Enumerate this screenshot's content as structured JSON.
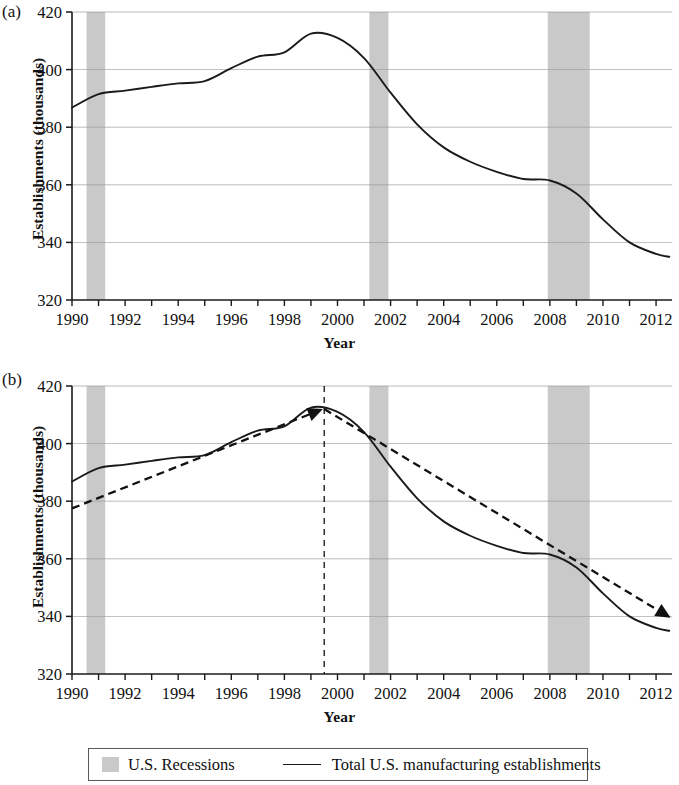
{
  "figure": {
    "panels": [
      {
        "letter": "(a)",
        "xlabel": "Year",
        "ylabel": "Establishments (thousands)"
      },
      {
        "letter": "(b)",
        "xlabel": "Year",
        "ylabel": "Establishments (thousands)"
      }
    ]
  },
  "legend": {
    "recessions_label": "U.S. Recessions",
    "series_label": "Total U.S. manufacturing establishments"
  },
  "colors": {
    "line": "#1a1a1a",
    "recession_band": "#c9c9c9",
    "gridline": "#9a9a9a",
    "axis": "#1a1a1a",
    "trend_arrow": "#111111"
  },
  "chart_data": [
    {
      "type": "line",
      "panel": "(a)",
      "title": "",
      "xlabel": "Year",
      "ylabel": "Establishments (thousands)",
      "xlim": [
        1990,
        2012.6
      ],
      "ylim": [
        320,
        420
      ],
      "yticks": [
        320,
        340,
        360,
        380,
        400,
        420
      ],
      "xticks": [
        1990,
        1991,
        1992,
        1993,
        1994,
        1995,
        1996,
        1997,
        1998,
        1999,
        2000,
        2001,
        2002,
        2003,
        2004,
        2005,
        2006,
        2007,
        2008,
        2009,
        2010,
        2011,
        2012
      ],
      "xtick_labels": [
        "1990",
        "",
        "1992",
        "",
        "1994",
        "",
        "1996",
        "",
        "1998",
        "",
        "2000",
        "",
        "2002",
        "",
        "2004",
        "",
        "2006",
        "",
        "2008",
        "",
        "2010",
        "",
        "2012"
      ],
      "grid": "horizontal",
      "legend_position": "below-figure",
      "series": [
        {
          "name": "Total U.S. manufacturing establishments",
          "x": [
            1990,
            1991,
            1992,
            1993,
            1994,
            1995,
            1996,
            1997,
            1998,
            1999,
            2000,
            2001,
            2002,
            2003,
            2004,
            2005,
            2006,
            2007,
            2008,
            2009,
            2010,
            2011,
            2012,
            2012.5
          ],
          "values": [
            386.8,
            391.5,
            392.7,
            394.0,
            395.2,
            396.0,
            400.5,
            404.5,
            406.0,
            412.5,
            411.0,
            404.0,
            392.0,
            381.0,
            373.0,
            368.0,
            364.5,
            362.0,
            361.5,
            357.0,
            348.0,
            340.0,
            336.0,
            335.0
          ]
        }
      ],
      "recession_bands": [
        {
          "name": "1990-91 recession",
          "start": 1990.55,
          "end": 1991.25
        },
        {
          "name": "2001 recession",
          "start": 2001.2,
          "end": 2001.92
        },
        {
          "name": "2007-09 recession",
          "start": 2007.92,
          "end": 2009.5
        }
      ]
    },
    {
      "type": "line",
      "panel": "(b)",
      "title": "",
      "xlabel": "Year",
      "ylabel": "Establishments (thousands)",
      "xlim": [
        1990,
        2012.6
      ],
      "ylim": [
        320,
        420
      ],
      "yticks": [
        320,
        340,
        360,
        380,
        400,
        420
      ],
      "xticks": [
        1990,
        1991,
        1992,
        1993,
        1994,
        1995,
        1996,
        1997,
        1998,
        1999,
        2000,
        2001,
        2002,
        2003,
        2004,
        2005,
        2006,
        2007,
        2008,
        2009,
        2010,
        2011,
        2012
      ],
      "xtick_labels": [
        "1990",
        "",
        "1992",
        "",
        "1994",
        "",
        "1996",
        "",
        "1998",
        "",
        "2000",
        "",
        "2002",
        "",
        "2004",
        "",
        "2006",
        "",
        "2008",
        "",
        "2010",
        "",
        "2012"
      ],
      "grid": "horizontal",
      "legend_position": "below-figure",
      "series": [
        {
          "name": "Total U.S. manufacturing establishments",
          "x": [
            1990,
            1991,
            1992,
            1993,
            1994,
            1995,
            1996,
            1997,
            1998,
            1999,
            2000,
            2001,
            2002,
            2003,
            2004,
            2005,
            2006,
            2007,
            2008,
            2009,
            2010,
            2011,
            2012,
            2012.5
          ],
          "values": [
            386.8,
            391.5,
            392.7,
            394.0,
            395.2,
            396.0,
            400.5,
            404.5,
            406.0,
            412.5,
            411.0,
            404.0,
            392.0,
            381.0,
            373.0,
            368.0,
            364.5,
            362.0,
            361.5,
            357.0,
            348.0,
            340.0,
            336.0,
            335.0
          ]
        }
      ],
      "recession_bands": [
        {
          "name": "1990-91 recession",
          "start": 1990.55,
          "end": 1991.25
        },
        {
          "name": "2001 recession",
          "start": 2001.2,
          "end": 2001.92
        },
        {
          "name": "2007-09 recession",
          "start": 2007.92,
          "end": 2009.5
        }
      ],
      "annotations": {
        "vertical_divider": {
          "x": 1999.5,
          "style": "dashed"
        },
        "trend_arrows": [
          {
            "name": "pre-2000 upward trend",
            "x0": 1990.0,
            "y0": 377.5,
            "x1": 1999.45,
            "y1": 412.0,
            "style": "dashed",
            "arrowhead": "end"
          },
          {
            "name": "post-2000 downward trend",
            "x0": 1999.5,
            "y0": 412.0,
            "x1": 2012.55,
            "y1": 339.5,
            "style": "dashed",
            "arrowhead": "end"
          }
        ]
      }
    }
  ]
}
